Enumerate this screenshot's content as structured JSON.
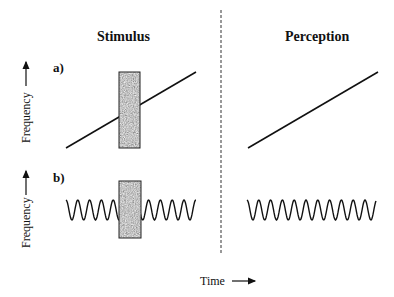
{
  "titles": {
    "left": "Stimulus",
    "right": "Perception"
  },
  "panels": {
    "a": "a)",
    "b": "b)"
  },
  "axes": {
    "y_label": "Frequency",
    "x_label": "Time"
  },
  "colors": {
    "line": "#111111",
    "noise_fill": "#8a8a8a",
    "divider": "#333333"
  }
}
